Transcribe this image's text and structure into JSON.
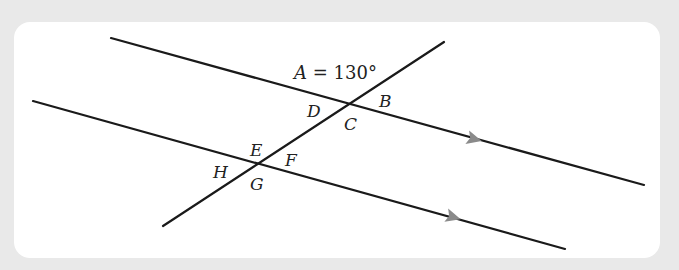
{
  "diagram": {
    "title_label": "A = 130°",
    "angle_given": {
      "name": "A",
      "value": "130°"
    },
    "labels": {
      "A_eq": "A = 130°",
      "B": "B",
      "C": "C",
      "D": "D",
      "E": "E",
      "F": "F",
      "G": "G",
      "H": "H"
    },
    "lines": [
      {
        "id": "parallel-line-upper",
        "from": [
          111,
          38
        ],
        "to": [
          644,
          185
        ],
        "arrow_at": [
          473,
          138
        ]
      },
      {
        "id": "parallel-line-lower",
        "from": [
          33,
          101
        ],
        "to": [
          565,
          249
        ],
        "arrow_at": [
          452,
          217
        ]
      },
      {
        "id": "transversal",
        "from": [
          444,
          42
        ],
        "to": [
          163,
          226
        ]
      }
    ],
    "intersections": [
      {
        "id": "upper-intersection",
        "point": [
          349,
          103
        ],
        "angles": [
          "A",
          "B",
          "C",
          "D"
        ]
      },
      {
        "id": "lower-intersection",
        "point": [
          258,
          164
        ],
        "angles": [
          "E",
          "F",
          "G",
          "H"
        ]
      }
    ],
    "colors": {
      "line": "#1a1a1a",
      "arrow": "#8a8a8a",
      "panel": "#ffffff",
      "background": "#e9e9e9"
    }
  }
}
